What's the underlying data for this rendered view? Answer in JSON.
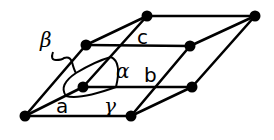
{
  "diagram": {
    "labels": {
      "a": "a",
      "b": "b",
      "c": "c",
      "alpha": "α",
      "beta": "β",
      "gamma": "γ"
    },
    "nodes": [
      {
        "id": "origin",
        "x": 25,
        "y": 116
      },
      {
        "id": "a-end",
        "x": 131,
        "y": 116
      },
      {
        "id": "b-end",
        "x": 83,
        "y": 87
      },
      {
        "id": "ab-end",
        "x": 192,
        "y": 87
      },
      {
        "id": "c-end",
        "x": 86,
        "y": 45
      },
      {
        "id": "ac-end",
        "x": 190,
        "y": 46
      },
      {
        "id": "bc-end",
        "x": 147,
        "y": 16
      },
      {
        "id": "abc-end",
        "x": 255,
        "y": 16
      }
    ],
    "colors": {
      "stroke": "#000000",
      "background": "#ffffff"
    }
  }
}
